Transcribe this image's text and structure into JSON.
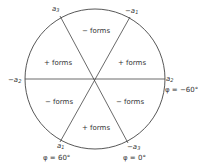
{
  "diagram": {
    "circle": {
      "cx": 95,
      "cy": 79,
      "r": 70,
      "stroke": "#444444"
    },
    "axes": [
      {
        "name": "a1",
        "from": [
          130,
          17
        ],
        "to": [
          60,
          142
        ]
      },
      {
        "name": "a2",
        "from": [
          25,
          79
        ],
        "to": [
          165,
          79
        ]
      },
      {
        "name": "a3",
        "from": [
          60,
          16
        ],
        "to": [
          128,
          143
        ]
      }
    ],
    "axis_labels": {
      "a3_top": "a",
      "a3_top_sub": "3",
      "neg_a1_top": "−a",
      "neg_a1_top_sub": "1",
      "neg_a2_left": "−a",
      "neg_a2_left_sub": "2",
      "a2_right": "a",
      "a2_right_sub": "2",
      "a1_bottom": "a",
      "a1_bottom_sub": "1",
      "neg_a3_bottom": "−a",
      "neg_a3_bottom_sub": "3"
    },
    "angle_labels": {
      "phi_neg60": "φ = −60°",
      "phi_60": "φ = 60°",
      "phi_0": "φ = 0°"
    },
    "sector_labels": {
      "top": "− forms",
      "upper_left": "+ forms",
      "upper_right": "+ forms",
      "lower_left": "− forms",
      "lower_right": "− forms",
      "bottom": "+ forms"
    }
  }
}
